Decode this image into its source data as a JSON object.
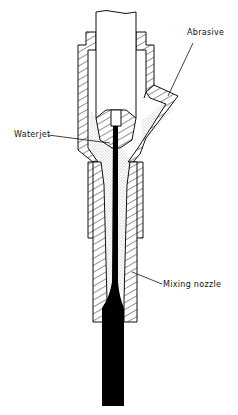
{
  "diagram": {
    "labels": {
      "abrasive": "Abrasive",
      "waterjet": "Waterjet",
      "mixing_nozzle": "Mixing nozzle"
    },
    "colors": {
      "line": "#111111",
      "jet": "#000000",
      "abrasive_fill": "#d8d8d8",
      "background": "#ffffff"
    }
  }
}
